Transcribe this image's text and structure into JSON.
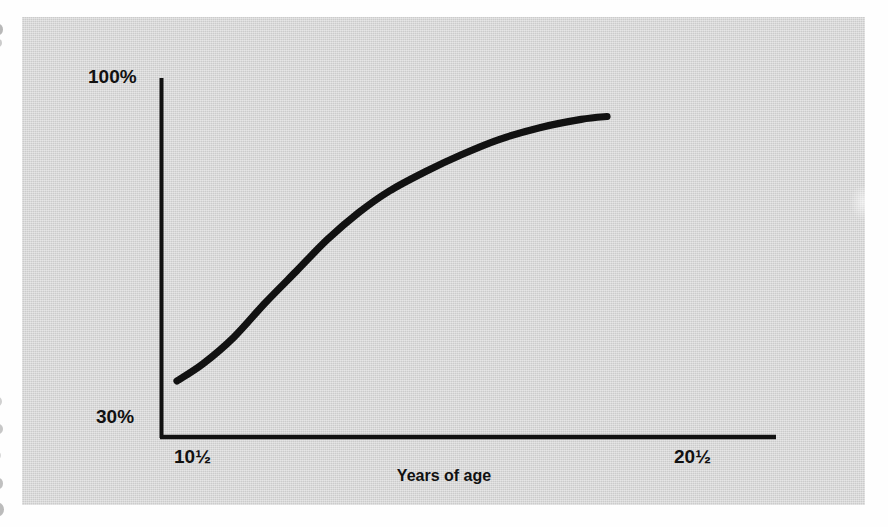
{
  "chart_data": {
    "type": "line",
    "title": "",
    "subtitle": "",
    "xlabel": "Years of age",
    "ylabel": "",
    "grid": false,
    "legend": null,
    "legend_position": "none",
    "annotations": [],
    "x_tick_labels": [
      "10½",
      "20½"
    ],
    "x_tick_values": [
      10.5,
      20.5
    ],
    "y_tick_labels": [
      "30%",
      "100%"
    ],
    "y_tick_values": [
      30,
      100
    ],
    "xlim": [
      9.8,
      20.5
    ],
    "ylim": [
      30,
      100
    ],
    "series": [
      {
        "name": "growth curve",
        "color": "#111111",
        "x": [
          10.1,
          10.6,
          11.2,
          11.8,
          12.4,
          13.0,
          13.6,
          14.2,
          14.9,
          15.6,
          16.3,
          17.1,
          17.9,
          18.4
        ],
        "y": [
          41.5,
          45.0,
          50.5,
          57.5,
          64.0,
          70.5,
          76.0,
          80.5,
          84.5,
          88.0,
          91.0,
          93.5,
          95.2,
          95.8
        ]
      }
    ]
  },
  "axes": {
    "y_max_label": "100%",
    "y_min_label": "30%",
    "x_left_label": "10½",
    "x_right_label": "20½",
    "x_axis_title": "Years of age",
    "axis_color": "#111111",
    "curve_color": "#111111"
  },
  "figure": {
    "background_color": "#d2d2d2",
    "page_color": "#fefefe"
  }
}
